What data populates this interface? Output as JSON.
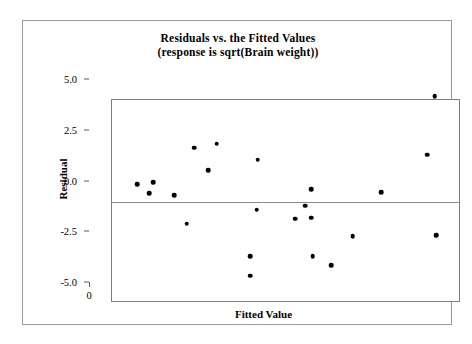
{
  "chart_data": {
    "type": "scatter",
    "title": "Residuals vs. the Fitted Values",
    "subtitle": "(response is sqrt(Brain weight))",
    "xlabel": "Fitted Value",
    "ylabel": "Residual",
    "xlim": [
      0,
      14
    ],
    "ylim": [
      -5.0,
      5.0
    ],
    "xticks": [
      "0",
      "2",
      "4",
      "6",
      "8",
      "10",
      "12",
      "14"
    ],
    "xtick_values": [
      0,
      2,
      4,
      6,
      8,
      10,
      12,
      14
    ],
    "yticks": [
      "5.0",
      "2.5",
      "0.0",
      "-2.5",
      "-5.0"
    ],
    "ytick_values": [
      5.0,
      2.5,
      0.0,
      -2.5,
      -5.0
    ],
    "grid": false,
    "legend": false,
    "reference_line": {
      "orientation": "horizontal",
      "value": 0.0
    },
    "marker": {
      "shape": "circle",
      "color": "#000000",
      "size": 4.6
    },
    "points": [
      {
        "x": 1.0,
        "y": 0.85
      },
      {
        "x": 1.65,
        "y": 0.95
      },
      {
        "x": 1.5,
        "y": 0.4
      },
      {
        "x": 2.5,
        "y": 0.3
      },
      {
        "x": 3.0,
        "y": -1.1
      },
      {
        "x": 3.3,
        "y": 2.65
      },
      {
        "x": 4.2,
        "y": 2.85
      },
      {
        "x": 3.85,
        "y": 1.55
      },
      {
        "x": 5.85,
        "y": 2.05
      },
      {
        "x": 5.8,
        "y": -0.4
      },
      {
        "x": 5.55,
        "y": -2.7
      },
      {
        "x": 5.55,
        "y": -3.65
      },
      {
        "x": 8.0,
        "y": 0.6
      },
      {
        "x": 7.75,
        "y": -0.2
      },
      {
        "x": 7.35,
        "y": -0.85
      },
      {
        "x": 8.0,
        "y": -0.8
      },
      {
        "x": 8.05,
        "y": -2.7
      },
      {
        "x": 8.8,
        "y": -3.15
      },
      {
        "x": 9.65,
        "y": -1.7
      },
      {
        "x": 10.8,
        "y": 0.45
      },
      {
        "x": 12.95,
        "y": 5.2
      },
      {
        "x": 12.65,
        "y": 2.3
      },
      {
        "x": 13.0,
        "y": -1.65
      }
    ]
  }
}
